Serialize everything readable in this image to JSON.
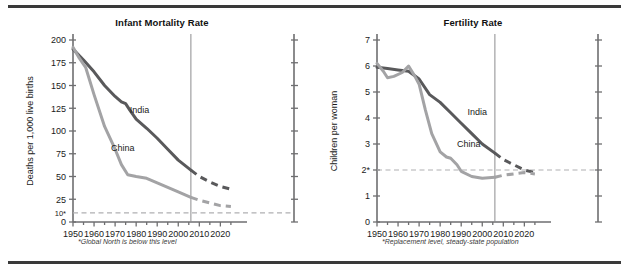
{
  "figure": {
    "background": "#ffffff",
    "rule_color": "#3a3a3a"
  },
  "colors": {
    "india": "#59595b",
    "china": "#a3a3a5",
    "axis": "#6e6e70",
    "text": "#1a1a1a",
    "dashed_reference": "#b0b0b2",
    "divider": "#8c8c8e"
  },
  "charts": [
    {
      "id": "infant-mortality",
      "title": "Infant Mortality Rate",
      "type": "line",
      "ylabel": "Deaths per 1,000 live births",
      "xlabel": "",
      "footnote": "*Global North is below this level",
      "xlim": [
        1950,
        2026
      ],
      "ylim": [
        0,
        200
      ],
      "xticks": [
        1950,
        1960,
        1970,
        1980,
        1990,
        2000,
        2010,
        2020
      ],
      "xtick_labels": [
        "1950",
        "1960",
        "1970",
        "1980",
        "1990",
        "2000",
        "2010",
        "2020"
      ],
      "xminor_step": 5,
      "yticks": [
        0,
        25,
        50,
        75,
        100,
        125,
        150,
        175,
        200
      ],
      "ytick_labels": [
        "0",
        "25",
        "50",
        "75",
        "100",
        "125",
        "150",
        "175",
        "200"
      ],
      "extra_ytick": {
        "value": 10,
        "label": "10*"
      },
      "reference_line": {
        "value": 10,
        "style": "dashed",
        "label": "Global North level"
      },
      "projection_divider": {
        "x": 2006,
        "style": "solid"
      },
      "grid": false,
      "legend_position": "inline-labels",
      "series": [
        {
          "name": "India",
          "color": "#59595b",
          "label_xy": [
            1977,
            120
          ],
          "observed": [
            [
              1950,
              190
            ],
            [
              1955,
              178
            ],
            [
              1960,
              165
            ],
            [
              1965,
              150
            ],
            [
              1970,
              138
            ],
            [
              1973,
              132
            ],
            [
              1975,
              130
            ],
            [
              1977,
              123
            ],
            [
              1980,
              113
            ],
            [
              1985,
              103
            ],
            [
              1990,
              92
            ],
            [
              1995,
              80
            ],
            [
              2000,
              68
            ],
            [
              2006,
              57
            ]
          ],
          "projected": [
            [
              2006,
              57
            ],
            [
              2010,
              50
            ],
            [
              2015,
              44
            ],
            [
              2020,
              39
            ],
            [
              2025,
              36
            ]
          ]
        },
        {
          "name": "China",
          "color": "#a3a3a5",
          "label_xy": [
            1968,
            78
          ],
          "observed": [
            [
              1950,
              192
            ],
            [
              1953,
              180
            ],
            [
              1956,
              170
            ],
            [
              1960,
              140
            ],
            [
              1965,
              105
            ],
            [
              1970,
              80
            ],
            [
              1973,
              63
            ],
            [
              1976,
              52
            ],
            [
              1980,
              50
            ],
            [
              1985,
              48
            ],
            [
              1990,
              43
            ],
            [
              1995,
              38
            ],
            [
              2000,
              33
            ],
            [
              2006,
              27
            ]
          ],
          "projected": [
            [
              2006,
              27
            ],
            [
              2010,
              24
            ],
            [
              2015,
              21
            ],
            [
              2020,
              18
            ],
            [
              2025,
              17
            ]
          ]
        }
      ]
    },
    {
      "id": "fertility-rate",
      "title": "Fertility Rate",
      "type": "line",
      "ylabel": "Children per woman",
      "xlabel": "",
      "footnote": "*Replacement level, steady-state population",
      "xlim": [
        1950,
        2026
      ],
      "ylim": [
        0,
        7
      ],
      "xticks": [
        1950,
        1960,
        1970,
        1980,
        1990,
        2000,
        2010,
        2020
      ],
      "xtick_labels": [
        "1950",
        "1960",
        "1970",
        "1980",
        "1990",
        "2000",
        "2010",
        "2020"
      ],
      "xminor_step": 5,
      "yticks": [
        0,
        1,
        2,
        3,
        4,
        5,
        6,
        7
      ],
      "ytick_labels": [
        "0",
        "1",
        "2*",
        "3",
        "4",
        "5",
        "6",
        "7"
      ],
      "reference_line": {
        "value": 2,
        "style": "dashed",
        "label": "Replacement level"
      },
      "projection_divider": {
        "x": 2006,
        "style": "solid"
      },
      "grid": false,
      "legend_position": "inline-labels",
      "series": [
        {
          "name": "India",
          "color": "#59595b",
          "label_xy": [
            1993,
            4.1
          ],
          "observed": [
            [
              1950,
              5.95
            ],
            [
              1955,
              5.9
            ],
            [
              1960,
              5.85
            ],
            [
              1965,
              5.8
            ],
            [
              1970,
              5.5
            ],
            [
              1975,
              4.9
            ],
            [
              1980,
              4.6
            ],
            [
              1985,
              4.2
            ],
            [
              1990,
              3.8
            ],
            [
              1995,
              3.4
            ],
            [
              2000,
              3.0
            ],
            [
              2006,
              2.65
            ]
          ],
          "projected": [
            [
              2006,
              2.65
            ],
            [
              2010,
              2.4
            ],
            [
              2015,
              2.2
            ],
            [
              2020,
              2.0
            ],
            [
              2025,
              1.9
            ]
          ]
        },
        {
          "name": "China",
          "color": "#a3a3a5",
          "label_xy": [
            1988,
            2.9
          ],
          "observed": [
            [
              1950,
              6.1
            ],
            [
              1953,
              5.8
            ],
            [
              1955,
              5.55
            ],
            [
              1958,
              5.6
            ],
            [
              1962,
              5.75
            ],
            [
              1965,
              6.0
            ],
            [
              1968,
              5.6
            ],
            [
              1970,
              5.3
            ],
            [
              1973,
              4.3
            ],
            [
              1976,
              3.4
            ],
            [
              1980,
              2.7
            ],
            [
              1983,
              2.5
            ],
            [
              1985,
              2.45
            ],
            [
              1988,
              2.2
            ],
            [
              1990,
              1.95
            ],
            [
              1995,
              1.75
            ],
            [
              2000,
              1.68
            ],
            [
              2003,
              1.7
            ],
            [
              2006,
              1.72
            ]
          ],
          "projected": [
            [
              2006,
              1.72
            ],
            [
              2010,
              1.8
            ],
            [
              2015,
              1.85
            ],
            [
              2020,
              1.9
            ],
            [
              2025,
              1.85
            ]
          ]
        }
      ]
    }
  ]
}
